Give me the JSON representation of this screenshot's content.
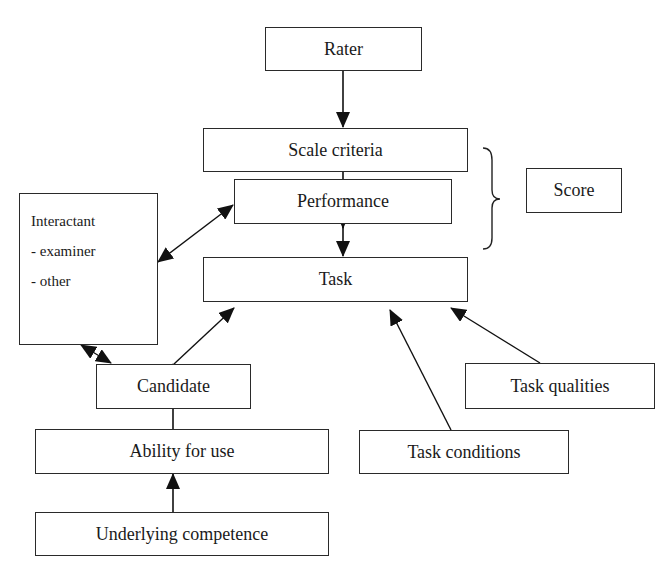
{
  "diagram": {
    "nodes": {
      "rater": "Rater",
      "scale_criteria": "Scale criteria",
      "score": "Score",
      "performance": "Performance",
      "interactant": {
        "title": "Interactant",
        "items": [
          "- examiner",
          "- other"
        ]
      },
      "task": "Task",
      "candidate": "Candidate",
      "task_qualities": "Task qualities",
      "ability_for_use": "Ability for use",
      "task_conditions": "Task conditions",
      "underlying_competence": "Underlying competence"
    },
    "edges": [
      {
        "from": "Rater",
        "to": "Scale criteria",
        "type": "arrow"
      },
      {
        "from": "Scale criteria",
        "to": "Performance",
        "type": "arrow"
      },
      {
        "from": "Performance",
        "to": "Task",
        "type": "arrow"
      },
      {
        "from": "Interactant",
        "to": "Performance",
        "type": "bidirectional"
      },
      {
        "from": "Interactant",
        "to": "Candidate",
        "type": "bidirectional"
      },
      {
        "from": "Candidate",
        "to": "Task",
        "type": "arrow"
      },
      {
        "from": "Task conditions",
        "to": "Task",
        "type": "arrow"
      },
      {
        "from": "Task qualities",
        "to": "Task",
        "type": "arrow"
      },
      {
        "from": "Ability for use",
        "to": "Candidate",
        "type": "arrow"
      },
      {
        "from": "Underlying competence",
        "to": "Ability for use",
        "type": "arrow"
      }
    ],
    "brace": {
      "groups": [
        "Scale criteria",
        "Performance"
      ],
      "label": "Score"
    }
  }
}
